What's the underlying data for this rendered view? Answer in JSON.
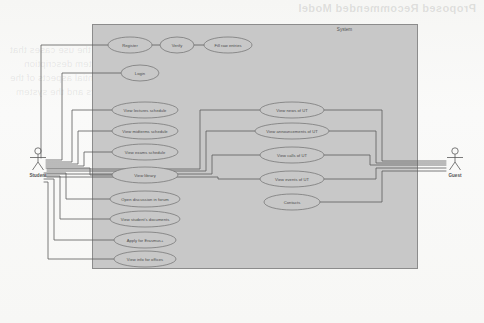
{
  "page": {
    "background_color": "#fbfbfa",
    "ghost_heading": "Proposed Recommended Model",
    "ghost_lines": [
      "Table with the correct description of the use cases that",
      "right actors and system description",
      "The diagram shows only the essential aspects of the",
      "interaction between the actors and the system"
    ]
  },
  "diagram": {
    "type": "uml-use-case-diagram",
    "system_boundary": {
      "label": "System",
      "x": 92,
      "y": 24,
      "width": 325,
      "height": 244,
      "fill": "#c8c8c8",
      "stroke": "#8c8c8c"
    },
    "colors": {
      "ellipse_fill": "#c8c8c8",
      "ellipse_stroke": "#6f6f6f",
      "connector": "#5a5a5a",
      "text": "#4a4a4a"
    },
    "actors": [
      {
        "id": "student",
        "label": "Student",
        "x": 38,
        "y": 163
      },
      {
        "id": "guest",
        "label": "Guest",
        "x": 455,
        "y": 163
      }
    ],
    "use_cases": [
      {
        "id": "register",
        "label": "Register",
        "cx": 130,
        "cy": 45,
        "rx": 22,
        "ry": 8
      },
      {
        "id": "verify",
        "label": "Verify",
        "cx": 177,
        "cy": 45,
        "rx": 17,
        "ry": 8
      },
      {
        "id": "fill-raw-entries",
        "label": "Fill raw entries",
        "cx": 228,
        "cy": 45,
        "rx": 24,
        "ry": 8
      },
      {
        "id": "login",
        "label": "Login",
        "cx": 140,
        "cy": 73,
        "rx": 19,
        "ry": 8
      },
      {
        "id": "view-lectures-schedule",
        "label": "View lectures schedule",
        "cx": 145,
        "cy": 110,
        "rx": 33,
        "ry": 8
      },
      {
        "id": "view-midterms-schedule",
        "label": "View midterms schedule",
        "cx": 145,
        "cy": 131,
        "rx": 33,
        "ry": 8
      },
      {
        "id": "view-exams-schedule",
        "label": "View exams schedule",
        "cx": 145,
        "cy": 152,
        "rx": 33,
        "ry": 8
      },
      {
        "id": "view-library",
        "label": "View library",
        "cx": 145,
        "cy": 175,
        "rx": 33,
        "ry": 8
      },
      {
        "id": "open-discussion-in-forum",
        "label": "Open discussion in forum",
        "cx": 145,
        "cy": 199,
        "rx": 35,
        "ry": 8
      },
      {
        "id": "view-students-documents",
        "label": "View student's documents",
        "cx": 145,
        "cy": 219,
        "rx": 35,
        "ry": 8
      },
      {
        "id": "apply-for-erasmus",
        "label": "Apply for Erasmus+",
        "cx": 145,
        "cy": 240,
        "rx": 31,
        "ry": 8
      },
      {
        "id": "view-info-for-offices",
        "label": "View info for offices",
        "cx": 145,
        "cy": 259,
        "rx": 31,
        "ry": 8
      },
      {
        "id": "view-news-of-ut",
        "label": "View news of UT",
        "cx": 292,
        "cy": 110,
        "rx": 32,
        "ry": 8
      },
      {
        "id": "view-announcements-of-ut",
        "label": "View announcements of UT",
        "cx": 292,
        "cy": 131,
        "rx": 37,
        "ry": 8
      },
      {
        "id": "view-calls-of-ut",
        "label": "View calls of UT",
        "cx": 292,
        "cy": 155,
        "rx": 32,
        "ry": 8
      },
      {
        "id": "view-events-of-ut",
        "label": "View events of UT",
        "cx": 292,
        "cy": 179,
        "rx": 32,
        "ry": 8
      },
      {
        "id": "contacts",
        "label": "Contacts",
        "cx": 292,
        "cy": 202,
        "rx": 28,
        "ry": 8
      }
    ],
    "associations": [
      {
        "from": "student",
        "to": "register"
      },
      {
        "from": "student",
        "to": "login"
      },
      {
        "from": "student",
        "to": "view-lectures-schedule"
      },
      {
        "from": "student",
        "to": "view-midterms-schedule"
      },
      {
        "from": "student",
        "to": "view-exams-schedule"
      },
      {
        "from": "student",
        "to": "view-library"
      },
      {
        "from": "student",
        "to": "open-discussion-in-forum"
      },
      {
        "from": "student",
        "to": "view-students-documents"
      },
      {
        "from": "student",
        "to": "apply-for-erasmus"
      },
      {
        "from": "student",
        "to": "view-info-for-offices"
      },
      {
        "from": "register",
        "to": "verify"
      },
      {
        "from": "verify",
        "to": "fill-raw-entries"
      },
      {
        "from": "guest",
        "to": "view-news-of-ut"
      },
      {
        "from": "guest",
        "to": "view-announcements-of-ut"
      },
      {
        "from": "guest",
        "to": "view-calls-of-ut"
      },
      {
        "from": "guest",
        "to": "view-events-of-ut"
      },
      {
        "from": "guest",
        "to": "contacts"
      },
      {
        "from": "student",
        "to": "view-news-of-ut"
      },
      {
        "from": "student",
        "to": "view-announcements-of-ut"
      },
      {
        "from": "student",
        "to": "view-calls-of-ut"
      },
      {
        "from": "student",
        "to": "view-events-of-ut"
      }
    ]
  }
}
